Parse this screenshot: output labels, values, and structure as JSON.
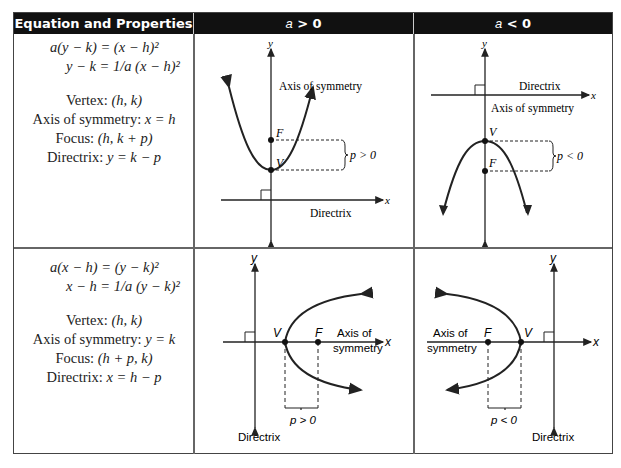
{
  "table": {
    "headers": [
      "Equation and Properties",
      "a > 0",
      "a < 0"
    ],
    "header_parts": [
      {
        "text": "Equation and Properties"
      },
      {
        "var": "a",
        "op": " > ",
        "val": "0"
      },
      {
        "var": "a",
        "op": " < ",
        "val": "0"
      }
    ],
    "rows": [
      {
        "equation_line1": "a(y − k) = (x − h)²",
        "equation_line2": "y − k = 1/a (x − h)²",
        "properties": [
          {
            "label": "Vertex:",
            "value": "(h, k)"
          },
          {
            "label": "Axis of symmetry:",
            "value": "x = h"
          },
          {
            "label": "Focus:",
            "value": "(h, k + p)"
          },
          {
            "label": "Directrix:",
            "value": "y = k − p"
          }
        ],
        "diagram_pos": {
          "labels": {
            "x": "x",
            "y": "y",
            "focus": "F",
            "vertex": "V",
            "p": "p > 0",
            "axis": "Axis of symmetry",
            "directrix": "Directrix"
          }
        },
        "diagram_neg": {
          "labels": {
            "x": "x",
            "y": "y",
            "focus": "F",
            "vertex": "V",
            "p": "p < 0",
            "axis": "Axis of symmetry",
            "directrix": "Directrix"
          }
        }
      },
      {
        "equation_line1": "a(x − h) = (y − k)²",
        "equation_line2": "x − h = 1/a (y − k)²",
        "properties": [
          {
            "label": "Vertex:",
            "value": "(h, k)"
          },
          {
            "label": "Axis of symmetry:",
            "value": "y = k"
          },
          {
            "label": "Focus:",
            "value": "(h + p, k)"
          },
          {
            "label": "Directrix:",
            "value": "x = h − p"
          }
        ],
        "diagram_pos": {
          "labels": {
            "x": "x",
            "y": "y",
            "focus": "F",
            "vertex": "V",
            "p": "p > 0",
            "axis_line1": "Axis of",
            "axis_line2": "symmetry",
            "directrix": "Directrix"
          }
        },
        "diagram_neg": {
          "labels": {
            "x": "x",
            "y": "y",
            "focus": "F",
            "vertex": "V",
            "p": "p < 0",
            "axis_line1": "Axis of",
            "axis_line2": "symmetry",
            "directrix": "Directrix"
          }
        }
      }
    ]
  },
  "colors": {
    "header_bg": "#111111",
    "header_text": "#ffffff",
    "border": "#666666",
    "ink": "#222222"
  }
}
